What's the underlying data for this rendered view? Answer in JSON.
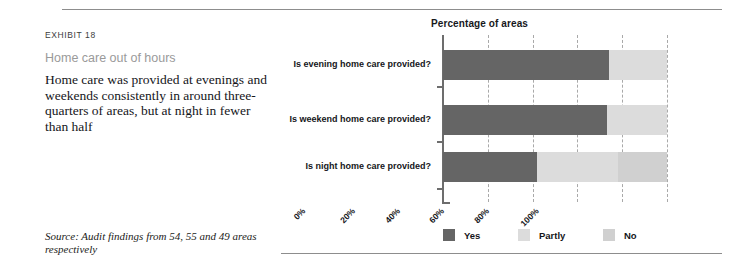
{
  "exhibit": {
    "number_label": "EXHIBIT 18",
    "subtitle": "Home care out of hours",
    "blurb": "Home care was provided at evenings and weekends consistently in around three-quarters of areas, but at night in fewer than half",
    "source": "Source: Audit findings from 54, 55 and 49 areas respectively"
  },
  "chart_data": {
    "type": "bar",
    "orientation": "horizontal",
    "stacked": true,
    "title": "Percentage of areas",
    "xlabel": "",
    "ylabel": "",
    "xlim": [
      0,
      100
    ],
    "grid": true,
    "legend_position": "bottom",
    "tick_labels": [
      "0%",
      "20%",
      "40%",
      "60%",
      "80%",
      "100%"
    ],
    "tick_values": [
      0,
      20,
      40,
      60,
      80,
      100
    ],
    "categories": [
      "Is evening home care provided?",
      "Is weekend home care provided?",
      "Is night home care provided?"
    ],
    "series": [
      {
        "name": "Yes",
        "color": "#656565",
        "values": [
          74,
          73,
          42
        ]
      },
      {
        "name": "Partly",
        "color": "#dcdcdc",
        "values": [
          26,
          27,
          36
        ]
      },
      {
        "name": "No",
        "color": "#d0d0d0",
        "values": [
          0,
          0,
          22
        ]
      }
    ]
  }
}
